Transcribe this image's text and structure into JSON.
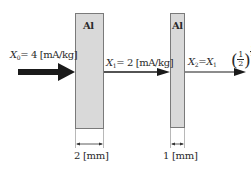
{
  "diagram": {
    "plates": [
      {
        "label": "Al",
        "thickness_label": "2 [mm]"
      },
      {
        "label": "Al",
        "thickness_label": "1 [mm]"
      }
    ],
    "beams": {
      "incident": {
        "symbol": "X",
        "subscript": "0",
        "expr": "= 4 [mA/kg]"
      },
      "after_plate1": {
        "symbol": "X",
        "subscript": "1",
        "expr": "= 2 [mA/kg]"
      },
      "after_plate2": {
        "symbol": "X",
        "subscript": "2",
        "eq": "=",
        "base_symbol": "X",
        "base_subscript": "1",
        "fraction_num": "1",
        "fraction_den": "2",
        "exponent_num": "1",
        "exponent_den": "2"
      }
    },
    "colors": {
      "plate_fill": "#d9d9d9",
      "plate_border": "#7a7a7a",
      "arrow": "#1a1a1a"
    }
  }
}
